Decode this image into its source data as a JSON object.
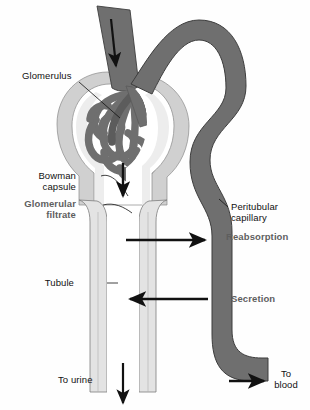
{
  "figure": {
    "background_color": "#fefefe"
  },
  "colors": {
    "vessel_dark": "#6f6f6f",
    "vessel_outline": "#3a3a3a",
    "capsule_light": "#d9d9d9",
    "capsule_mid": "#c9c9c9",
    "tubule_fill": "#e3e3e3",
    "tubule_lumen": "#ffffff",
    "arrow_black": "#111111",
    "label_black": "#111111",
    "label_gray": "#5e5e5e"
  },
  "labels": {
    "glomerulus": "Glomerulus",
    "bowman_capsule": "Bowman\ncapsule",
    "glomerular_filtrate": "Glomerular\nfiltrate",
    "tubule": "Tubule",
    "to_urine": "To urine",
    "peritubular_capillary": "Peritubular\ncapillary",
    "reabsorption": "Reabsorption",
    "secretion": "Secretion",
    "to_blood": "To\nblood"
  },
  "structures": [
    {
      "name": "afferent-arteriole",
      "description": "incoming blood vessel entering glomerulus",
      "color": "#6f6f6f"
    },
    {
      "name": "efferent-arteriole",
      "description": "outgoing vessel arching right from glomerulus",
      "color": "#6f6f6f"
    },
    {
      "name": "glomerulus-capillary-tuft",
      "description": "tangled capillary loops",
      "color": "#6f6f6f"
    },
    {
      "name": "bowman-capsule",
      "description": "cup shaped capsule surrounding glomerulus",
      "color": "#d9d9d9"
    },
    {
      "name": "renal-tubule",
      "description": "two parallel tubule walls descending",
      "color": "#e3e3e3"
    },
    {
      "name": "peritubular-capillary",
      "description": "S-curved vessel along the tubule",
      "color": "#6f6f6f"
    }
  ],
  "flow_arrows": [
    {
      "name": "blood-inflow-arrow",
      "direction": "down",
      "label": ""
    },
    {
      "name": "filtrate-arrow",
      "direction": "down",
      "label": ""
    },
    {
      "name": "reabsorption-arrow",
      "direction": "right",
      "label": "Reabsorption"
    },
    {
      "name": "secretion-arrow",
      "direction": "left",
      "label": "Secretion"
    },
    {
      "name": "to-urine-arrow",
      "direction": "down",
      "label": "To urine"
    },
    {
      "name": "to-blood-arrow",
      "direction": "right",
      "label": "To blood"
    }
  ]
}
